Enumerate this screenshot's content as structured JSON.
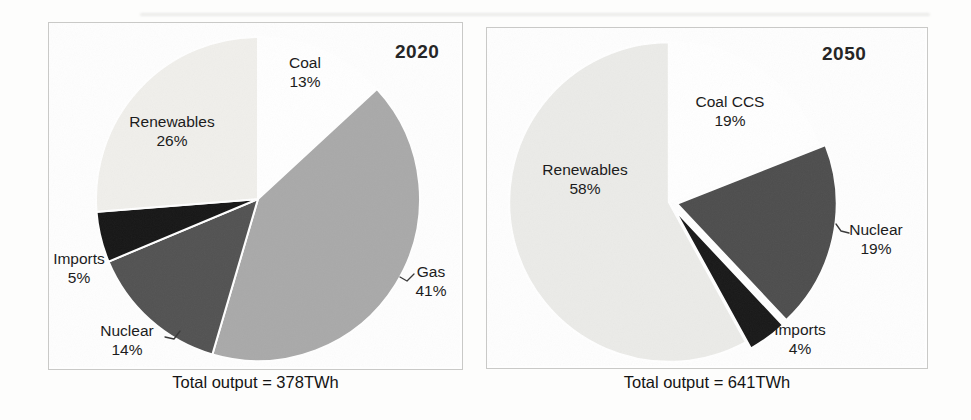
{
  "figure": {
    "kind": "two-pie-comparison",
    "background": "#fdfdfc",
    "panel_border_color": "#c9c9c7"
  },
  "chart_data": [
    {
      "type": "pie",
      "title": "2020",
      "caption": "Total output = 378TWh",
      "total_output_twh": 378,
      "start_angle_deg": 0,
      "direction": "clockwise",
      "legend_position": "none",
      "slices": [
        {
          "label": "Coal",
          "value": 13,
          "pct_label": "13%",
          "color": "#ffffff"
        },
        {
          "label": "Gas",
          "value": 41,
          "pct_label": "41%",
          "color": "#a9a9a9"
        },
        {
          "label": "Nuclear",
          "value": 14,
          "pct_label": "14%",
          "color": "#525252"
        },
        {
          "label": "Imports",
          "value": 5,
          "pct_label": "5%",
          "color": "#161616"
        },
        {
          "label": "Renewables",
          "value": 26,
          "pct_label": "26%",
          "color": "#f0efeb"
        }
      ]
    },
    {
      "type": "pie",
      "title": "2050",
      "caption": "Total output = 641TWh",
      "total_output_twh": 641,
      "start_angle_deg": 0,
      "direction": "clockwise",
      "legend_position": "none",
      "slices": [
        {
          "label": "Coal CCS",
          "value": 19,
          "pct_label": "19%",
          "color": "#ffffff"
        },
        {
          "label": "Nuclear",
          "value": 19,
          "pct_label": "19%",
          "color": "#4d4d4d",
          "explode": 8
        },
        {
          "label": "Imports",
          "value": 4,
          "pct_label": "4%",
          "color": "#181818",
          "explode": 8
        },
        {
          "label": "Renewables",
          "value": 58,
          "pct_label": "58%",
          "color": "#ebebe8"
        }
      ]
    }
  ]
}
